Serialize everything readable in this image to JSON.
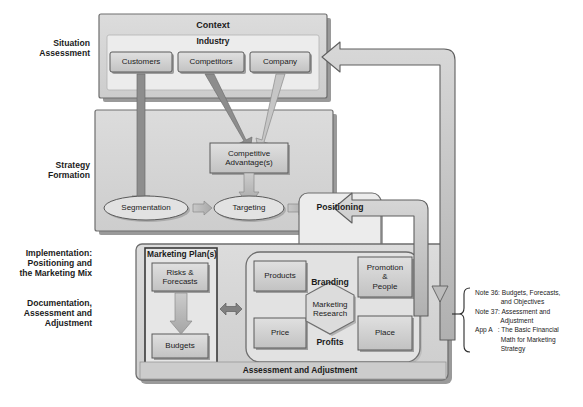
{
  "diagram": {
    "stage_labels": [
      {
        "id": "situation-assessment",
        "text": "Situation\nAssessment"
      },
      {
        "id": "strategy-formation",
        "text": "Strategy\nFormation"
      },
      {
        "id": "implementation",
        "text": "Implementation:\nPositioning and\nthe Marketing Mix"
      },
      {
        "id": "documentation",
        "text": "Documentation,\nAssessment and\nAdjustment"
      }
    ],
    "context_panel": {
      "title": "Context",
      "industry_label": "Industry",
      "boxes": [
        {
          "id": "customers",
          "label": "Customers"
        },
        {
          "id": "competitors",
          "label": "Competitors"
        },
        {
          "id": "company",
          "label": "Company"
        }
      ]
    },
    "strategy_panel": {
      "competitive_advantage": "Competitive\nAdvantage(s)",
      "ellipses": [
        {
          "id": "segmentation",
          "label": "Segmentation"
        },
        {
          "id": "targeting",
          "label": "Targeting"
        }
      ]
    },
    "positioning": {
      "label": "Positioning"
    },
    "marketing_plan": {
      "title": "Marketing Plan(s)",
      "boxes": [
        {
          "id": "risks-forecasts",
          "label": "Risks &\nForecasts"
        },
        {
          "id": "budgets",
          "label": "Budgets"
        }
      ]
    },
    "marketing_mix": {
      "branding_label": "Branding",
      "profits_label": "Profits",
      "center": "Marketing\nResearch",
      "boxes": [
        {
          "id": "products",
          "label": "Products"
        },
        {
          "id": "promotion-people",
          "label": "Promotion\n&\nPeople"
        },
        {
          "id": "price",
          "label": "Price"
        },
        {
          "id": "place",
          "label": "Place"
        }
      ]
    },
    "footer_bar": {
      "label": "Assessment and Adjustment"
    },
    "notes": [
      {
        "key": "Note 36:",
        "text": "Budgets, Forecasts,\n             and Objectives"
      },
      {
        "key": "Note 37:",
        "text": "Assessment and\n             Adjustment"
      },
      {
        "key": "App A   :",
        "text": "The Basic Financial\n             Math for Marketing\n             Strategy"
      }
    ],
    "notes_block": "Note 36: Budgets, Forecasts,\n              and Objectives\nNote 37: Assessment and\n              Adjustment\nApp A   : The Basic Financial\n              Math for Marketing\n              Strategy",
    "colors": {
      "panel_fill": "#d3d3d3",
      "inner_fill": "#e6e6e6",
      "box_fill": "#cfcfcf",
      "arrow_fill": "#b9b9b9",
      "outline": "#4a4a4a",
      "text": "#1b1b1b",
      "background": "#ffffff"
    }
  }
}
